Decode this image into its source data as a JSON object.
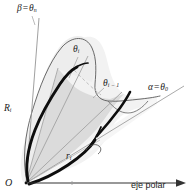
{
  "figure": {
    "kind": "polar-area-diagram",
    "background": "#ffffff",
    "labels": {
      "beta_ray": {
        "symbol": "β",
        "equals": "=",
        "value_symbol": "θ",
        "value_sub": "n",
        "full": "β = θₙ"
      },
      "theta_i": {
        "symbol": "θ",
        "sub": "i",
        "full": "θᵢ"
      },
      "theta_i_minus_1": {
        "symbol": "θ",
        "sub": "i − 1",
        "full": "θᵢ₋₁"
      },
      "alpha_ray": {
        "symbol": "α",
        "equals": "=",
        "value_symbol": "θ",
        "value_sub": "0",
        "full": "α = θ₀"
      },
      "outer_radius": {
        "symbol": "R",
        "sub": "i",
        "full": "Rᵢ"
      },
      "inner_radius": {
        "symbol": "r",
        "sub": "i",
        "full": "rᵢ"
      },
      "origin": {
        "symbol": "O",
        "full": "O"
      },
      "polar_axis": {
        "text": "eje polar"
      }
    },
    "colors": {
      "outline": "#4a4a4a",
      "thick_curve": "#0d0d0d",
      "ray": "#8d8d8d",
      "dashed_ray": "#a8a8a8",
      "axis": "#3a3a3a",
      "fill_light": "#f1f1f1",
      "fill_mid": "#e3e3e3",
      "fill_sector": "#d5d5d5",
      "text": "#1a1a1a"
    }
  }
}
